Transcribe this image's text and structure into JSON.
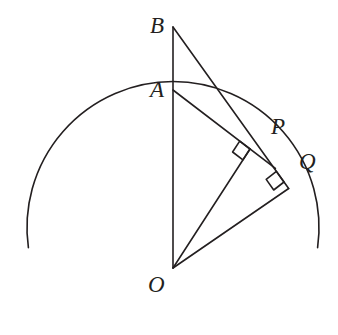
{
  "figure": {
    "background_color": "#ffffff",
    "stroke_color": "#231f20",
    "stroke_width": 1.6,
    "labels": {
      "B": "B",
      "A": "A",
      "O": "O",
      "P": "P",
      "Q": "Q"
    },
    "points": {
      "O": {
        "x": 173,
        "y": 268,
        "role": "circle-center"
      },
      "A": {
        "x": 173,
        "y": 90,
        "role": "point-on-vertical-ray"
      },
      "B": {
        "x": 173,
        "y": 27,
        "role": "point-on-vertical-ray"
      },
      "P": {
        "x": 250,
        "y": 149,
        "role": "tangent-point-foot-from-A"
      },
      "Q": {
        "x": 284,
        "y": 182,
        "role": "tangent-point-foot-from-B"
      },
      "T": {
        "x": 173,
        "y": 125,
        "role": "circle-top-on-vertical"
      }
    },
    "circle": {
      "center_x": 173,
      "center_y": 268,
      "radius": 146,
      "arc_visible_from_deg": 172,
      "arc_visible_to_deg": 8,
      "note": "upper arc only; cut off below by image edge"
    },
    "segments": [
      {
        "name": "segment-BO",
        "from": "B",
        "to": "O"
      },
      {
        "name": "segment-BQ",
        "from": "B",
        "to": "Q"
      },
      {
        "name": "segment-AP",
        "from": "A",
        "to": "P"
      },
      {
        "name": "segment-OP",
        "from": "O",
        "to": "P"
      },
      {
        "name": "segment-OQ",
        "from": "O",
        "to": "Q"
      }
    ],
    "right_angle_marks": [
      {
        "name": "right-angle-at-P",
        "vertex": "P",
        "size": 13
      },
      {
        "name": "right-angle-at-Q",
        "vertex": "Q",
        "size": 13
      }
    ]
  }
}
